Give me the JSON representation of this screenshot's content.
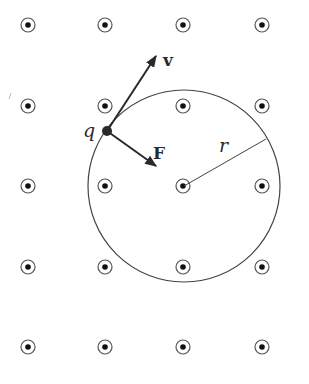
{
  "diagram": {
    "field_symbol": "dot-in-circle (B out of page)",
    "grid": {
      "columns_x": [
        28,
        105,
        183,
        262
      ],
      "rows_y": [
        25,
        106,
        186,
        267,
        347
      ]
    },
    "orbit": {
      "cx": 184,
      "cy": 186,
      "r": 96
    },
    "charge": {
      "label": "q",
      "x": 107,
      "y": 131
    },
    "velocity": {
      "label": "v",
      "x2": 157,
      "y2": 55
    },
    "force": {
      "label": "F",
      "x2": 157,
      "y2": 167
    },
    "radius": {
      "label": "r",
      "x2": 266,
      "y2": 139
    },
    "colors": {
      "ink": "#2a2a2a",
      "background": "#ffffff"
    }
  }
}
